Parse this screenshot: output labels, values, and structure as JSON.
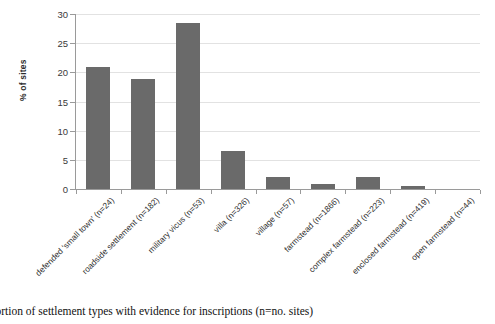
{
  "chart_data": {
    "type": "bar",
    "title": "",
    "xlabel": "",
    "ylabel": "% of sites",
    "ylim": [
      0,
      30
    ],
    "yticks": [
      0,
      5,
      10,
      15,
      20,
      25,
      30
    ],
    "grid": true,
    "legend": null,
    "bar_color": "#6a6a6a",
    "categories": [
      "defended 'small town' (n=24)",
      "roadside settlement (n=182)",
      "military vicus (n=53)",
      "villa (n=326)",
      "village (n=57)",
      "farmstead (n=1866)",
      "complex farmstead (n=223)",
      "enclosed farmstead (n=419)",
      "open farmstead (n=44)"
    ],
    "values": [
      20.9,
      18.9,
      28.4,
      6.6,
      2.0,
      0.9,
      2.0,
      0.6,
      0.0
    ]
  },
  "caption": {
    "text": "oportion of settlement types with evidence for inscriptions (n=no. sites)"
  },
  "axis": {
    "y_title": "% of sites",
    "tick_0": "0",
    "tick_5": "5",
    "tick_10": "10",
    "tick_15": "15",
    "tick_20": "20",
    "tick_25": "25",
    "tick_30": "30"
  }
}
